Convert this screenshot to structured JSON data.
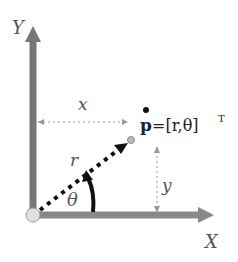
{
  "diagram": {
    "axes": {
      "x_label": "X",
      "y_label": "Y"
    },
    "labels": {
      "x_distance": "x",
      "y_distance": "y",
      "radius": "r",
      "angle": "θ",
      "point_bold": "p",
      "point_equation": "=[r,θ]",
      "transpose": "T"
    },
    "colors": {
      "axis": "#777777",
      "radius_line": "#111111",
      "guide_line": "#999999",
      "origin_fill": "#e0e0e0",
      "text": "#555555"
    }
  }
}
